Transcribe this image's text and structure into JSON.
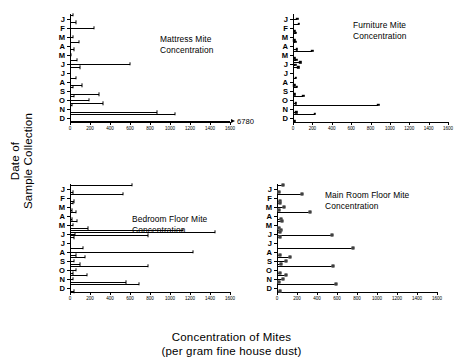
{
  "axes": {
    "y_title": "Date of\nSample Collection",
    "x_title_line1": "Concentration of Mites",
    "x_title_line2": "(per gram fine house dust)",
    "x_ticks": [
      0,
      200,
      400,
      600,
      800,
      1000,
      1200,
      1400,
      1600
    ],
    "x_tick_labels": [
      "0",
      "200",
      "400",
      "600",
      "800",
      "1000",
      "1200",
      "1400",
      "1600"
    ],
    "x_min": 0,
    "x_max": 1600,
    "months": [
      "J",
      "F",
      "M",
      "A",
      "M",
      "J",
      "J",
      "A",
      "S",
      "O",
      "N",
      "D"
    ]
  },
  "chart_data": [
    {
      "type": "bar",
      "orientation": "horizontal",
      "panel": "top-left",
      "title": "Mattress Mite\nConcentration",
      "marker": "tick",
      "xlabel": "Concentration of Mites (per gram fine house dust)",
      "ylabel": "Date of Sample Collection",
      "xlim": [
        0,
        1600
      ],
      "categories": [
        "J",
        "F",
        "M",
        "A",
        "M",
        "J",
        "J",
        "A",
        "S",
        "O",
        "N",
        "D"
      ],
      "annotation": {
        "text": "6780",
        "month": "D",
        "note": "bar extends off-scale, arrow indicates value"
      },
      "points": [
        {
          "month": "J",
          "value": 30
        },
        {
          "month": "J",
          "value": 55
        },
        {
          "month": "F",
          "value": 240
        },
        {
          "month": "M",
          "value": 25
        },
        {
          "month": "A",
          "value": 90
        },
        {
          "month": "A",
          "value": 40
        },
        {
          "month": "M",
          "value": 10
        },
        {
          "month": "J",
          "value": 70
        },
        {
          "month": "J",
          "value": 600
        },
        {
          "month": "J",
          "value": 95
        },
        {
          "month": "A",
          "value": 55
        },
        {
          "month": "A",
          "value": 120
        },
        {
          "month": "S",
          "value": 30
        },
        {
          "month": "S",
          "value": 290
        },
        {
          "month": "O",
          "value": 35
        },
        {
          "month": "O",
          "value": 190
        },
        {
          "month": "O",
          "value": 330
        },
        {
          "month": "N",
          "value": 20
        },
        {
          "month": "N",
          "value": 870
        },
        {
          "month": "D",
          "value": 1050
        },
        {
          "month": "D",
          "value": 6780
        }
      ]
    },
    {
      "type": "bar",
      "orientation": "horizontal",
      "panel": "top-right",
      "title": "Furniture Mite\nConcentration",
      "marker": "filled-square",
      "xlabel": "Concentration of Mites (per gram fine house dust)",
      "ylabel": "Date of Sample Collection",
      "xlim": [
        0,
        1600
      ],
      "categories": [
        "J",
        "F",
        "M",
        "A",
        "M",
        "J",
        "J",
        "A",
        "S",
        "O",
        "N",
        "D"
      ],
      "points": [
        {
          "month": "J",
          "value": 45
        },
        {
          "month": "F",
          "value": 60
        },
        {
          "month": "F",
          "value": 20
        },
        {
          "month": "M",
          "value": 30
        },
        {
          "month": "M",
          "value": 15
        },
        {
          "month": "A",
          "value": 25
        },
        {
          "month": "A",
          "value": 40
        },
        {
          "month": "M",
          "value": 200
        },
        {
          "month": "M",
          "value": 20
        },
        {
          "month": "J",
          "value": 35
        },
        {
          "month": "J",
          "value": 75
        },
        {
          "month": "J",
          "value": 25
        },
        {
          "month": "J",
          "value": 55
        },
        {
          "month": "A",
          "value": 30
        },
        {
          "month": "A",
          "value": 15
        },
        {
          "month": "S",
          "value": 40
        },
        {
          "month": "S",
          "value": 20
        },
        {
          "month": "O",
          "value": 105
        },
        {
          "month": "O",
          "value": 30
        },
        {
          "month": "N",
          "value": 880
        },
        {
          "month": "N",
          "value": 35
        },
        {
          "month": "D",
          "value": 225
        },
        {
          "month": "D",
          "value": 20
        }
      ]
    },
    {
      "type": "bar",
      "orientation": "horizontal",
      "panel": "bottom-left",
      "title": "Bedroom Floor Mite\nConcentration",
      "marker": "tick",
      "xlabel": "Concentration of Mites (per gram fine house dust)",
      "ylabel": "Date of Sample Collection",
      "xlim": [
        0,
        1600
      ],
      "categories": [
        "J",
        "F",
        "M",
        "A",
        "M",
        "J",
        "J",
        "A",
        "S",
        "O",
        "N",
        "D"
      ],
      "points": [
        {
          "month": "J",
          "value": 620
        },
        {
          "month": "J",
          "value": 30
        },
        {
          "month": "F",
          "value": 530
        },
        {
          "month": "F",
          "value": 40
        },
        {
          "month": "M",
          "value": 25
        },
        {
          "month": "M",
          "value": 15
        },
        {
          "month": "A",
          "value": 60
        },
        {
          "month": "A",
          "value": 20
        },
        {
          "month": "M",
          "value": 70
        },
        {
          "month": "M",
          "value": 30
        },
        {
          "month": "M",
          "value": 175
        },
        {
          "month": "J",
          "value": 1130
        },
        {
          "month": "J",
          "value": 1450
        },
        {
          "month": "J",
          "value": 45
        },
        {
          "month": "J",
          "value": 780
        },
        {
          "month": "J",
          "value": 35
        },
        {
          "month": "A",
          "value": 130
        },
        {
          "month": "A",
          "value": 1230
        },
        {
          "month": "A",
          "value": 55
        },
        {
          "month": "S",
          "value": 150
        },
        {
          "month": "S",
          "value": 40
        },
        {
          "month": "S",
          "value": 95
        },
        {
          "month": "O",
          "value": 780
        },
        {
          "month": "O",
          "value": 60
        },
        {
          "month": "O",
          "value": 30
        },
        {
          "month": "N",
          "value": 170
        },
        {
          "month": "N",
          "value": 25
        },
        {
          "month": "N",
          "value": 560
        },
        {
          "month": "D",
          "value": 690
        },
        {
          "month": "D",
          "value": 35
        }
      ]
    },
    {
      "type": "bar",
      "orientation": "horizontal",
      "panel": "bottom-right",
      "title": "Main Room Floor Mite\nConcentration",
      "marker": "open-square",
      "xlabel": "Concentration of Mites (per gram fine house dust)",
      "ylabel": "Date of Sample Collection",
      "xlim": [
        0,
        1600
      ],
      "categories": [
        "J",
        "F",
        "M",
        "A",
        "M",
        "J",
        "J",
        "A",
        "S",
        "O",
        "N",
        "D"
      ],
      "points": [
        {
          "month": "J",
          "value": 60
        },
        {
          "month": "J",
          "value": 20
        },
        {
          "month": "F",
          "value": 250
        },
        {
          "month": "F",
          "value": 30
        },
        {
          "month": "M",
          "value": 25
        },
        {
          "month": "M",
          "value": 70
        },
        {
          "month": "M",
          "value": 15
        },
        {
          "month": "A",
          "value": 330
        },
        {
          "month": "A",
          "value": 35
        },
        {
          "month": "M",
          "value": 45
        },
        {
          "month": "M",
          "value": 20
        },
        {
          "month": "J",
          "value": 40
        },
        {
          "month": "J",
          "value": 25
        },
        {
          "month": "J",
          "value": 545
        },
        {
          "month": "J",
          "value": 30
        },
        {
          "month": "A",
          "value": 760
        },
        {
          "month": "A",
          "value": 25
        },
        {
          "month": "S",
          "value": 130
        },
        {
          "month": "S",
          "value": 90
        },
        {
          "month": "S",
          "value": 35
        },
        {
          "month": "O",
          "value": 560
        },
        {
          "month": "O",
          "value": 30
        },
        {
          "month": "N",
          "value": 85
        },
        {
          "month": "N",
          "value": 60
        },
        {
          "month": "N",
          "value": 20
        },
        {
          "month": "D",
          "value": 590
        },
        {
          "month": "D",
          "value": 30
        }
      ]
    }
  ]
}
